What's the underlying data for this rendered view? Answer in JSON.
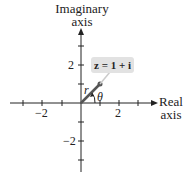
{
  "diagram": {
    "y_axis_label_line1": "Imaginary",
    "y_axis_label_line2": "axis",
    "x_axis_label_line1": "Real",
    "x_axis_label_line2": "axis",
    "x_ticks": [
      "−2",
      "2"
    ],
    "y_ticks": [
      "2",
      "−2"
    ],
    "point_label": "z = 1 + i",
    "modulus_label": "r",
    "angle_label": "θ",
    "point": {
      "x": 1,
      "y": 1
    },
    "colors": {
      "axes": "#222222",
      "vector": "#555555",
      "callout_bg": "#e2e2e2"
    }
  }
}
